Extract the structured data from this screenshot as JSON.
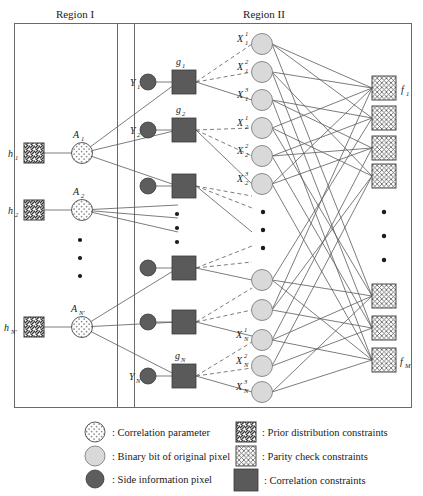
{
  "figure": {
    "type": "factor-graph-diagram",
    "regions": [
      {
        "id": "region1",
        "title": "Region I"
      },
      {
        "id": "region2",
        "title": "Region II"
      }
    ]
  },
  "region1": {
    "title": "Region I",
    "prior_nodes": [
      {
        "label": "h",
        "sub": "1"
      },
      {
        "label": "h",
        "sub": "2"
      },
      {
        "label": "h",
        "sub": "N'"
      }
    ],
    "correlation_params": [
      {
        "label": "A",
        "sub": "1"
      },
      {
        "label": "A",
        "sub": "2"
      },
      {
        "label": "A",
        "sub": "N'"
      }
    ],
    "ellipsis_count": 3
  },
  "region2": {
    "title": "Region II",
    "side_info_nodes": [
      {
        "label": "Y",
        "sub": "1"
      },
      {
        "label": "Y",
        "sub": "2"
      },
      {
        "label": "",
        "sub": ""
      },
      {
        "label": "",
        "sub": ""
      },
      {
        "label": "",
        "sub": ""
      },
      {
        "label": "Y",
        "sub": "N"
      }
    ],
    "correlation_constraints": [
      {
        "label": "g",
        "sub": "1"
      },
      {
        "label": "g",
        "sub": "2"
      },
      {
        "label": "",
        "sub": ""
      },
      {
        "label": "",
        "sub": ""
      },
      {
        "label": "",
        "sub": ""
      },
      {
        "label": "g",
        "sub": "N"
      }
    ],
    "bit_nodes": [
      {
        "label": "X",
        "sub": "1",
        "sup": "1"
      },
      {
        "label": "X",
        "sub": "1",
        "sup": "2"
      },
      {
        "label": "X",
        "sub": "1",
        "sup": "3"
      },
      {
        "label": "X",
        "sub": "2",
        "sup": "1"
      },
      {
        "label": "X",
        "sub": "2",
        "sup": "2"
      },
      {
        "label": "X",
        "sub": "2",
        "sup": "3"
      },
      {
        "label": "",
        "sub": "",
        "sup": ""
      },
      {
        "label": "",
        "sub": "",
        "sup": ""
      },
      {
        "label": "",
        "sub": "",
        "sup": ""
      },
      {
        "label": "X",
        "sub": "N",
        "sup": "1"
      },
      {
        "label": "X",
        "sub": "N",
        "sup": "2"
      },
      {
        "label": "X",
        "sub": "N",
        "sup": "3"
      }
    ],
    "parity_check_nodes": [
      {
        "label": "f",
        "sub": "1"
      },
      {
        "label": "",
        "sub": ""
      },
      {
        "label": "",
        "sub": ""
      },
      {
        "label": "",
        "sub": ""
      },
      {
        "label": "",
        "sub": ""
      },
      {
        "label": "",
        "sub": ""
      },
      {
        "label": "f",
        "sub": "M"
      }
    ],
    "ellipsis_count": 3
  },
  "legend": {
    "left_column": [
      {
        "icon": "dotted-circle-icon",
        "text": ": Correlation parameter"
      },
      {
        "icon": "light-circle-icon",
        "text": ": Binary bit of original pixel"
      },
      {
        "icon": "dark-circle-icon",
        "text": ": Side information pixel"
      }
    ],
    "right_column": [
      {
        "icon": "diagonal-hatch-square-icon",
        "text": ": Prior distribution constraints"
      },
      {
        "icon": "cross-hatch-square-icon",
        "text": ": Parity check constraints"
      },
      {
        "icon": "filled-square-icon",
        "text": ": Correlation constraints"
      }
    ]
  },
  "colors": {
    "background": "#ffffff",
    "stroke": "#5a5a5a",
    "box_stroke": "#6a6a6a",
    "dark_node": "#5d5d5d",
    "light_node": "#d9d9d9",
    "filled_square": "#5a5a5a",
    "text": "#1a1a1a"
  }
}
